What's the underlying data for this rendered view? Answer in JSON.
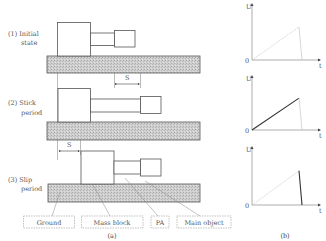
{
  "panel_a": {
    "caption": "(a)",
    "stages": [
      {
        "label_line1": "(1) Initial",
        "label_line2": "state"
      },
      {
        "label_line1": "(2) Stick",
        "label_line2": "period"
      },
      {
        "label_line1": "(3) Slip",
        "label_line2": "period"
      }
    ],
    "displacement_label": "S",
    "legend": [
      "Ground",
      "Mass block",
      "PA",
      "Main object"
    ]
  },
  "panel_b": {
    "caption": "(b)",
    "y_axis_label": "U",
    "x_axis_label": "t",
    "origin_label": "0",
    "charts": [
      {
        "name": "initial",
        "rise_highlight": false,
        "fall_highlight": false
      },
      {
        "name": "stick",
        "rise_highlight": true,
        "fall_highlight": false
      },
      {
        "name": "slip",
        "rise_highlight": false,
        "fall_highlight": true
      }
    ]
  },
  "colors": {
    "line": "#555555",
    "ground_fill": "#c8c8c8",
    "highlight": "#333333",
    "faint": "#bbbbbb"
  }
}
